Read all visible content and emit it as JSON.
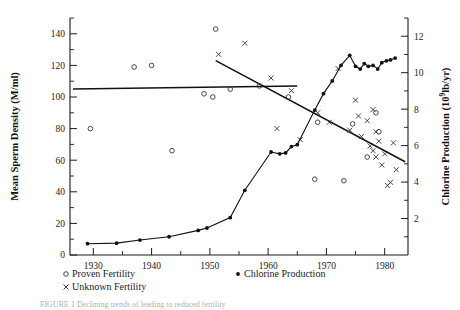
{
  "figure": {
    "caption_partial": "FIGURE 1 Declining trends of leading to reduced fertility"
  },
  "chart_data": {
    "type": "scatter",
    "title": "",
    "xlabel": "",
    "xlim": [
      1926,
      1984
    ],
    "xticks": [
      1930,
      1940,
      1950,
      1960,
      1970,
      1980
    ],
    "xtick_labels": [
      "1930",
      "1940",
      "1950",
      "1960",
      "1970",
      "1980"
    ],
    "xticks_minor": [
      1935,
      1945,
      1955,
      1965,
      1975
    ],
    "grid": false,
    "left_axis": {
      "ylabel": "Mean Sperm Density (M/ml)",
      "ylim": [
        0,
        150
      ],
      "yticks": [
        0,
        20,
        40,
        60,
        80,
        100,
        120,
        140
      ],
      "ytick_labels": [
        "0",
        "20",
        "40",
        "60",
        "80",
        "100",
        "120",
        "140"
      ],
      "yticks_minor": [
        10,
        30,
        50,
        70,
        90,
        110,
        130,
        150
      ]
    },
    "right_axis": {
      "ylabel": "Chlorine Production (10⁹lb/yr)",
      "ylim": [
        0,
        13
      ],
      "yticks": [
        2,
        4,
        6,
        8,
        10,
        12
      ],
      "ytick_labels": [
        "2",
        "4",
        "6",
        "8",
        "10",
        "12"
      ],
      "yticks_minor": [
        1,
        3,
        5,
        7,
        9,
        11,
        13
      ]
    },
    "series": [
      {
        "name": "Proven Fertility",
        "marker": "open-circle",
        "axis": "left",
        "points": [
          [
            1929.5,
            80
          ],
          [
            1937.0,
            119
          ],
          [
            1940.0,
            120
          ],
          [
            1943.5,
            66
          ],
          [
            1949.0,
            102
          ],
          [
            1950.5,
            100
          ],
          [
            1951.0,
            143
          ],
          [
            1953.5,
            105
          ],
          [
            1958.5,
            107
          ],
          [
            1963.5,
            100
          ],
          [
            1968.0,
            48
          ],
          [
            1968.5,
            84
          ],
          [
            1973.0,
            47
          ],
          [
            1974.5,
            83
          ],
          [
            1977.0,
            62
          ],
          [
            1978.5,
            90
          ],
          [
            1979.0,
            78
          ]
        ]
      },
      {
        "name": "Unknown Fertility",
        "marker": "x",
        "axis": "left",
        "points": [
          [
            1951.5,
            127
          ],
          [
            1956.0,
            134
          ],
          [
            1960.5,
            112
          ],
          [
            1961.5,
            80
          ],
          [
            1964.0,
            104
          ],
          [
            1965.5,
            73
          ],
          [
            1968.5,
            90
          ],
          [
            1970.5,
            84
          ],
          [
            1972.0,
            118
          ],
          [
            1974.0,
            79
          ],
          [
            1975.0,
            98
          ],
          [
            1975.5,
            88
          ],
          [
            1976.0,
            75
          ],
          [
            1977.0,
            85
          ],
          [
            1977.5,
            69
          ],
          [
            1978.0,
            92
          ],
          [
            1978.0,
            66
          ],
          [
            1978.5,
            78
          ],
          [
            1978.5,
            62
          ],
          [
            1979.0,
            72
          ],
          [
            1979.5,
            57
          ],
          [
            1980.0,
            64
          ],
          [
            1980.5,
            44
          ],
          [
            1981.0,
            46
          ],
          [
            1981.5,
            71
          ],
          [
            1982.0,
            54
          ]
        ]
      },
      {
        "name": "Chlorine Production",
        "marker": "filled-dot",
        "axis": "right",
        "points": [
          [
            1929,
            0.62
          ],
          [
            1934,
            0.65
          ],
          [
            1938,
            0.82
          ],
          [
            1943,
            1.0
          ],
          [
            1948,
            1.35
          ],
          [
            1949.5,
            1.48
          ],
          [
            1953.5,
            2.05
          ],
          [
            1956,
            3.55
          ],
          [
            1960.5,
            5.65
          ],
          [
            1962,
            5.55
          ],
          [
            1963,
            5.6
          ],
          [
            1964,
            5.95
          ],
          [
            1965,
            6.05
          ],
          [
            1968,
            7.95
          ],
          [
            1969.5,
            8.85
          ],
          [
            1971,
            9.55
          ],
          [
            1972.5,
            10.4
          ],
          [
            1974,
            10.95
          ],
          [
            1975,
            10.35
          ],
          [
            1975.8,
            10.2
          ],
          [
            1976.5,
            10.5
          ],
          [
            1977.2,
            10.35
          ],
          [
            1978,
            10.4
          ],
          [
            1978.8,
            10.2
          ],
          [
            1979.5,
            10.55
          ],
          [
            1980.3,
            10.65
          ],
          [
            1981,
            10.7
          ],
          [
            1981.8,
            10.8
          ]
        ]
      }
    ],
    "trend_lines": [
      {
        "name": "overall-flat-trend",
        "axis": "left",
        "x": [
          1926.5,
          1965.0
        ],
        "y": [
          105,
          107
        ]
      },
      {
        "name": "declining-trend",
        "axis": "left",
        "x": [
          1951.0,
          1983.5
        ],
        "y": [
          123,
          59
        ]
      }
    ],
    "legend": {
      "position": "below-axes",
      "entries": [
        {
          "label": "Proven Fertility",
          "marker": "open-circle"
        },
        {
          "label": "Unknown Fertility",
          "marker": "x"
        },
        {
          "label": "Chlorine Production",
          "marker": "filled-dot"
        }
      ]
    }
  }
}
